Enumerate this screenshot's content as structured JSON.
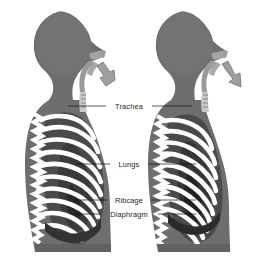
{
  "diagram": {
    "background_color": "#ffffff",
    "body_fill_color": "#6e6e6e",
    "body_shadow_color": "#5a5a5a",
    "bone_color": "#ffffff",
    "cavity_dark_color": "#4a4a4a",
    "cavity_darkest_color": "#2e2e2e",
    "airway_color": "#8d8d8d",
    "arrow_fill_color": "#9e9e9e",
    "arrow_stroke_color": "#6b6b6b",
    "label_text_color": "#1d1d1d",
    "leader_line_color": "#111111"
  },
  "labels": [
    {
      "id": "trachea",
      "text": "Trachea",
      "x": 129,
      "y": 109,
      "leader_left_x1": 68,
      "leader_left_x2": 106,
      "leader_right_x1": 152,
      "leader_right_x2": 192,
      "leader_y": 106
    },
    {
      "id": "lungs",
      "text": "Lungs",
      "x": 129,
      "y": 167,
      "leader_left_x1": 76,
      "leader_left_x2": 110,
      "leader_right_x1": 148,
      "leader_right_x2": 196,
      "leader_y": 164
    },
    {
      "id": "ribcage",
      "text": "Ribcage",
      "x": 129,
      "y": 203,
      "leader_left_x1": 74,
      "leader_left_x2": 107,
      "leader_right_x1": 151,
      "leader_right_x2": 196,
      "leader_y": 200
    },
    {
      "id": "diaphragm",
      "text": "Diaphragm",
      "x": 129,
      "y": 217,
      "leader_left_x1": 74,
      "leader_left_x2": 100,
      "leader_right_x1": 158,
      "leader_right_x2": 196,
      "leader_y": 214
    }
  ],
  "figures": [
    {
      "id": "left-figure",
      "name": "inhalation-figure",
      "breath_phase": "inhale",
      "arrow_direction": "into-nose-upward",
      "offset_x": 0
    },
    {
      "id": "right-figure",
      "name": "exhalation-figure",
      "breath_phase": "exhale",
      "arrow_direction": "out-of-nose-downward",
      "offset_x": 122
    }
  ],
  "arrows": {
    "inhale": {
      "label": "air-in-arrow",
      "points": "106,86 100,78 104,76 97,66 103,62 110,72 114,70 115,80"
    },
    "exhale": {
      "label": "air-out-arrow",
      "points": "222,64 228,61 235,75 240,73 241,87 229,82 233,79 226,70"
    }
  }
}
